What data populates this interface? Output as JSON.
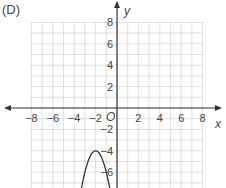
{
  "panel_label": "(D)",
  "chart_data": {
    "type": "line",
    "title": "",
    "xlabel": "x",
    "ylabel": "y",
    "origin_label": "O",
    "xlim": [
      -8,
      8
    ],
    "ylim": [
      -8,
      8
    ],
    "grid": true,
    "grid_step": 1,
    "x_ticks": [
      -8,
      -6,
      -4,
      -2,
      2,
      4,
      6,
      8
    ],
    "y_ticks": [
      8,
      6,
      4,
      2,
      -2,
      -4,
      -6
    ],
    "x_tick_labels": [
      "−8",
      "−6",
      "−4",
      "−2",
      "2",
      "4",
      "6",
      "8"
    ],
    "y_tick_labels": [
      "8",
      "6",
      "4",
      "2",
      "−2",
      "−4",
      "−6"
    ],
    "series": [
      {
        "name": "parabola",
        "equation": "y = -2(x+2)^2 - 4",
        "vertex": [
          -2,
          -4
        ],
        "opens": "down",
        "points": [
          [
            -3.37,
            -7.75
          ],
          [
            -3.0,
            -6
          ],
          [
            -2.5,
            -4.5
          ],
          [
            -2,
            -4
          ],
          [
            -1.5,
            -4.5
          ],
          [
            -1.0,
            -6
          ],
          [
            -0.63,
            -7.75
          ]
        ]
      }
    ]
  }
}
